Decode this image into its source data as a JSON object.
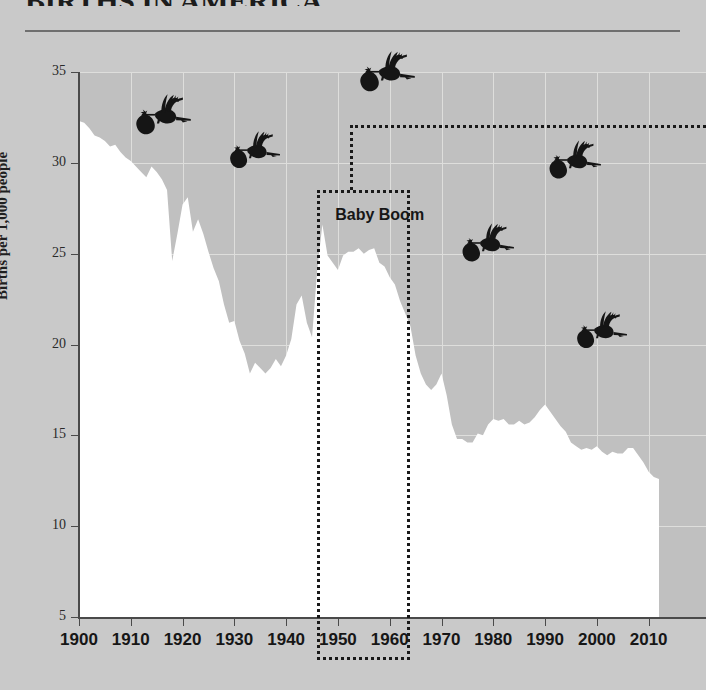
{
  "header": {
    "title": "BIRTHS IN AMERICA",
    "rule": true
  },
  "axes": {
    "y_caption": "Births per 1,000 people",
    "y_ticks": [
      "35",
      "30",
      "25",
      "20",
      "15",
      "10",
      "5"
    ],
    "x_ticks": [
      "1900",
      "1910",
      "1920",
      "1930",
      "1940",
      "1950",
      "1960",
      "1970",
      "1980",
      "1990",
      "2000",
      "2010"
    ]
  },
  "annotations": {
    "baby_boom_label": "Baby Boom",
    "baby_boom_start_year": 1946,
    "baby_boom_end_year": 1964,
    "callout_present": true
  },
  "storks": [
    {
      "name": "stork-1915",
      "x": 124,
      "y": 93,
      "w": 68,
      "h": 52
    },
    {
      "name": "stork-1931",
      "x": 219,
      "y": 130,
      "w": 62,
      "h": 48
    },
    {
      "name": "stork-1953",
      "x": 347,
      "y": 50,
      "w": 70,
      "h": 52
    },
    {
      "name": "stork-1976",
      "x": 451,
      "y": 222,
      "w": 64,
      "h": 50
    },
    {
      "name": "stork-1992",
      "x": 538,
      "y": 139,
      "w": 64,
      "h": 50
    },
    {
      "name": "stork-1999",
      "x": 566,
      "y": 310,
      "w": 62,
      "h": 48
    }
  ],
  "colors": {
    "background": "#c9c9c9",
    "plot_background": "#c0c0c0",
    "area_fill": "#ffffff",
    "gridline": "#dededc",
    "axis": "#4a4a4a",
    "ink": "#161616",
    "rule": "#6f6f6f"
  },
  "chart_data": {
    "type": "area",
    "title": "BIRTHS IN AMERICA",
    "xlabel": "",
    "ylabel": "Births per 1,000 people",
    "xlim": [
      1900,
      2012
    ],
    "ylim": [
      5,
      35
    ],
    "grid": true,
    "legend": "none",
    "series_name": "US birth rate (births per 1,000 people)",
    "x": [
      1900,
      1901,
      1902,
      1903,
      1904,
      1905,
      1906,
      1907,
      1908,
      1909,
      1910,
      1911,
      1912,
      1913,
      1914,
      1915,
      1916,
      1917,
      1918,
      1919,
      1920,
      1921,
      1922,
      1923,
      1924,
      1925,
      1926,
      1927,
      1928,
      1929,
      1930,
      1931,
      1932,
      1933,
      1934,
      1935,
      1936,
      1937,
      1938,
      1939,
      1940,
      1941,
      1942,
      1943,
      1944,
      1945,
      1946,
      1947,
      1948,
      1949,
      1950,
      1951,
      1952,
      1953,
      1954,
      1955,
      1956,
      1957,
      1958,
      1959,
      1960,
      1961,
      1962,
      1963,
      1964,
      1965,
      1966,
      1967,
      1968,
      1969,
      1970,
      1971,
      1972,
      1973,
      1974,
      1975,
      1976,
      1977,
      1978,
      1979,
      1980,
      1981,
      1982,
      1983,
      1984,
      1985,
      1986,
      1987,
      1988,
      1989,
      1990,
      1991,
      1992,
      1993,
      1994,
      1995,
      1996,
      1997,
      1998,
      1999,
      2000,
      2001,
      2002,
      2003,
      2004,
      2005,
      2006,
      2007,
      2008,
      2009,
      2010,
      2011,
      2012
    ],
    "values": [
      32.3,
      32.2,
      31.9,
      31.5,
      31.4,
      31.2,
      30.9,
      31.0,
      30.6,
      30.3,
      30.1,
      29.8,
      29.5,
      29.2,
      29.8,
      29.5,
      29.1,
      28.5,
      24.6,
      26.1,
      27.7,
      28.1,
      26.2,
      26.9,
      26.1,
      25.1,
      24.2,
      23.5,
      22.2,
      21.2,
      21.3,
      20.2,
      19.5,
      18.4,
      19.0,
      18.7,
      18.4,
      18.7,
      19.2,
      18.8,
      19.4,
      20.3,
      22.2,
      22.7,
      21.2,
      20.4,
      24.1,
      26.6,
      24.9,
      24.5,
      24.1,
      24.9,
      25.1,
      25.1,
      25.3,
      25.0,
      25.2,
      25.3,
      24.5,
      24.3,
      23.7,
      23.3,
      22.4,
      21.7,
      21.0,
      19.4,
      18.4,
      17.8,
      17.5,
      17.8,
      18.4,
      17.2,
      15.6,
      14.8,
      14.8,
      14.6,
      14.6,
      15.1,
      15.0,
      15.6,
      15.9,
      15.8,
      15.9,
      15.6,
      15.6,
      15.8,
      15.6,
      15.7,
      16.0,
      16.4,
      16.7,
      16.3,
      15.9,
      15.5,
      15.2,
      14.6,
      14.4,
      14.2,
      14.3,
      14.2,
      14.4,
      14.1,
      13.9,
      14.1,
      14.0,
      14.0,
      14.3,
      14.3,
      13.9,
      13.5,
      13.0,
      12.7,
      12.6
    ],
    "annotations": [
      {
        "label": "Baby Boom",
        "x_start": 1946,
        "x_end": 1964,
        "y_top": 28.5,
        "style": "dotted-box"
      }
    ]
  }
}
